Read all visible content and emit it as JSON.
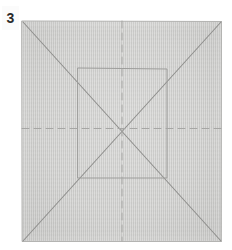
{
  "figure": {
    "step_label": "3",
    "caption": "",
    "sheet": {
      "name": "square-paper-sheet",
      "fill_color": "#c9c9c7",
      "edge_color": "#b0b0ae",
      "x": 22,
      "y": 21,
      "width": 200,
      "height": 221
    },
    "background_color": "#ffffff",
    "label_box_color": "#fbfbfb",
    "label_text_color": "#2a2a2a"
  },
  "line_styles": {
    "solid_crease": {
      "name": "valley-fold-solid-line",
      "color": "#8f8f8d",
      "width": 1.1,
      "dash": "none"
    },
    "solid_crease_light": {
      "name": "mountain-fold-solid-line",
      "color": "#9d9d9b",
      "width": 1.0,
      "dash": "none"
    },
    "dashed_crease": {
      "name": "dashed-fold-line",
      "color": "#a6a6a4",
      "width": 1.0,
      "dash": "7 5"
    },
    "sheet_edge": {
      "name": "sheet-edge-line",
      "color": "#b4b4b2",
      "width": 1.0,
      "dash": "none"
    }
  },
  "geometry": {
    "sheet_corners": {
      "top_left": [
        22,
        21
      ],
      "top_right": [
        221.5,
        21.5
      ],
      "bottom_right": [
        221,
        241.5
      ],
      "bottom_left": [
        22.5,
        241.5
      ]
    },
    "center_point": [
      122,
      128
    ],
    "inner_square": {
      "name": "inner-square-crease",
      "top_left": [
        78,
        68
      ],
      "top_right": [
        167,
        69
      ],
      "bottom_right": [
        167,
        178
      ],
      "bottom_left": [
        78,
        178
      ]
    },
    "diagonals": [
      {
        "name": "diagonal-crease-tl-br",
        "from": [
          23,
          22
        ],
        "to": [
          221,
          241
        ]
      },
      {
        "name": "diagonal-crease-tr-bl",
        "from": [
          221,
          22
        ],
        "to": [
          23,
          241
        ]
      }
    ],
    "dashed_lines": [
      {
        "name": "vertical-center-dashed-crease",
        "from": [
          122,
          21
        ],
        "to": [
          122,
          241
        ]
      },
      {
        "name": "horizontal-center-dashed-crease",
        "from": [
          22,
          128.5
        ],
        "to": [
          221,
          128.5
        ]
      }
    ]
  }
}
